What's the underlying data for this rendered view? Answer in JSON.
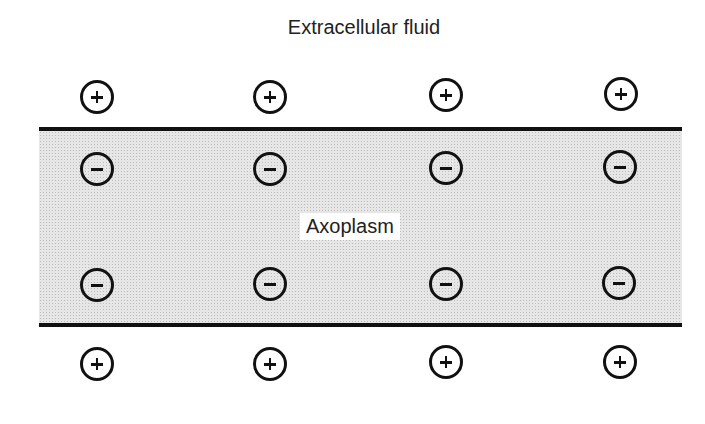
{
  "diagram": {
    "title": "Extracellular fluid",
    "inner_label": "Axoplasm",
    "colors": {
      "membrane": "#111111",
      "axoplasm": "#e6e6e6",
      "background": "#ffffff"
    },
    "ions": {
      "outer_top": [
        {
          "charge": "+",
          "x": 97,
          "y": 97
        },
        {
          "charge": "+",
          "x": 270,
          "y": 97
        },
        {
          "charge": "+",
          "x": 446,
          "y": 95
        },
        {
          "charge": "+",
          "x": 621,
          "y": 94
        }
      ],
      "inner_top": [
        {
          "charge": "-",
          "x": 97,
          "y": 169
        },
        {
          "charge": "-",
          "x": 270,
          "y": 169
        },
        {
          "charge": "-",
          "x": 446,
          "y": 168
        },
        {
          "charge": "-",
          "x": 620,
          "y": 167
        }
      ],
      "inner_bottom": [
        {
          "charge": "-",
          "x": 97,
          "y": 285
        },
        {
          "charge": "-",
          "x": 270,
          "y": 284
        },
        {
          "charge": "-",
          "x": 446,
          "y": 284
        },
        {
          "charge": "-",
          "x": 619,
          "y": 283
        }
      ],
      "outer_bottom": [
        {
          "charge": "+",
          "x": 97,
          "y": 364
        },
        {
          "charge": "+",
          "x": 270,
          "y": 364
        },
        {
          "charge": "+",
          "x": 446,
          "y": 362
        },
        {
          "charge": "+",
          "x": 620,
          "y": 362
        }
      ]
    }
  }
}
